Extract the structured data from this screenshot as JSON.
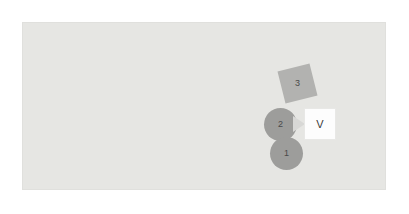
{
  "canvas": {
    "background_color": "#e6e6e3",
    "border_color": "#e0e0dd"
  },
  "diagram": {
    "nodes": [
      {
        "id": "node-one",
        "label": "1",
        "shape": "circle",
        "fill": "#9d9d9b",
        "x": 247,
        "y": 114,
        "size": 33
      },
      {
        "id": "node-two",
        "label": "2",
        "shape": "circle",
        "fill": "#9d9d9b",
        "x": 241,
        "y": 85,
        "size": 33
      },
      {
        "id": "node-three",
        "label": "3",
        "shape": "rotated-square",
        "fill": "#b2b2b0",
        "rotation_deg": -14,
        "x": 258,
        "y": 44,
        "size": 33
      }
    ],
    "value_box": {
      "label": "V",
      "fill": "#fdfdfd",
      "border": "#e8e8e6",
      "text_color": "#3a3a3a",
      "x": 281,
      "y": 85,
      "size": 32
    },
    "pointer": {
      "name": "triangle-pointer",
      "fill": "#d8d8d6",
      "direction": "right"
    }
  }
}
